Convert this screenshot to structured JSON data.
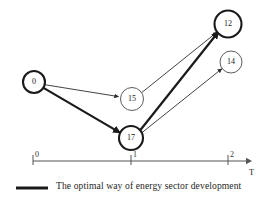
{
  "figure": {
    "title": "",
    "background_color": "#ffffff"
  },
  "diagram": {
    "type": "directed-graph-over-time-axis",
    "nodes": [
      {
        "id": "n0",
        "label": "0",
        "cx": 34,
        "cy": 82,
        "r": 11,
        "emphasis": "bold"
      },
      {
        "id": "n15",
        "label": "15",
        "cx": 132,
        "cy": 99,
        "r": 11.5,
        "emphasis": "thin"
      },
      {
        "id": "n17",
        "label": "17",
        "cx": 131,
        "cy": 138,
        "r": 12,
        "emphasis": "bold"
      },
      {
        "id": "n12",
        "label": "12",
        "cx": 228,
        "cy": 24,
        "r": 13.5,
        "emphasis": "bold"
      },
      {
        "id": "n14",
        "label": "14",
        "cx": 231,
        "cy": 62,
        "r": 11,
        "emphasis": "thin"
      }
    ],
    "edges": [
      {
        "from": "0",
        "to": "15",
        "emphasis": "thin",
        "arrow": true
      },
      {
        "from": "0",
        "to": "17",
        "emphasis": "bold",
        "arrow": true
      },
      {
        "from": "15",
        "to": "12",
        "emphasis": "thin",
        "arrow": true
      },
      {
        "from": "17",
        "to": "12",
        "emphasis": "bold",
        "arrow": true
      },
      {
        "from": "17",
        "to": "14",
        "emphasis": "thin",
        "arrow": true
      }
    ],
    "colors": {
      "node_bold_stroke": "#1a1a1a",
      "node_thin_stroke": "#4a4a4a",
      "edge_bold": "#1a1a1a",
      "edge_thin": "#2e2e2e",
      "axis": "#555555",
      "text": "#1f1f1f"
    }
  },
  "axis": {
    "name": "T",
    "ticks": [
      {
        "value": "0",
        "x": 33
      },
      {
        "value": "1",
        "x": 131
      },
      {
        "value": "2",
        "x": 228
      }
    ],
    "y": 161,
    "x_start": 33,
    "x_end": 249
  },
  "legend": {
    "swatch": "optimal-path-line",
    "text": "The optimal way of energy sector development"
  }
}
